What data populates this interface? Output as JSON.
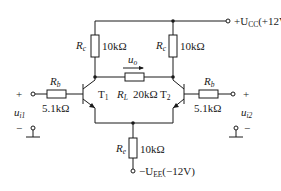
{
  "circuit": {
    "type": "differential amplifier",
    "supply_positive": {
      "symbol": "+U",
      "sub": "CC",
      "value": "(+12V)"
    },
    "supply_negative": {
      "symbol": "−U",
      "sub": "EE",
      "value": "(−12V)"
    },
    "collector_resistors": {
      "symbol": "R",
      "sub": "c",
      "value": "10kΩ"
    },
    "emitter_resistor": {
      "symbol": "R",
      "sub": "e",
      "value": "10kΩ"
    },
    "load_resistor": {
      "symbol": "R",
      "sub": "L",
      "value": "20kΩ"
    },
    "base_resistors": {
      "symbol": "R",
      "sub": "b",
      "value": "5.1kΩ"
    },
    "transistors": [
      {
        "symbol": "T",
        "sub": "1"
      },
      {
        "symbol": "T",
        "sub": "2"
      }
    ],
    "output": {
      "symbol": "u",
      "sub": "o"
    },
    "inputs": [
      {
        "symbol": "u",
        "sub": "i1",
        "plus": "+",
        "minus": "−"
      },
      {
        "symbol": "u",
        "sub": "i2",
        "plus": "+",
        "minus": "−"
      }
    ]
  }
}
